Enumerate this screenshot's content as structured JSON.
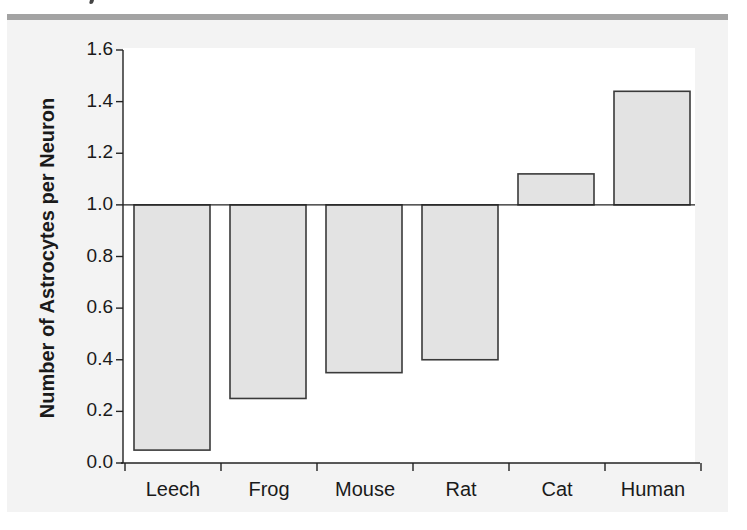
{
  "chart_data": {
    "type": "bar",
    "title": "",
    "xlabel": "",
    "ylabel": "Number of Astrocytes per Neuron",
    "categories": [
      "Leech",
      "Frog",
      "Mouse",
      "Rat",
      "Cat",
      "Human"
    ],
    "values": [
      0.05,
      0.25,
      0.35,
      0.4,
      1.12,
      1.44
    ],
    "baseline": 1.0,
    "ylim": [
      0.0,
      1.6
    ],
    "yticks": [
      "0.0",
      "0.2",
      "0.4",
      "0.6",
      "0.8",
      "1.0",
      "1.2",
      "1.4",
      "1.6"
    ],
    "grid": false,
    "legend": null,
    "colors": {
      "bar_fill": "#e3e3e3",
      "bar_stroke": "#3a3a3a",
      "axis": "#222222",
      "panel": "#f3f3f3",
      "band": "#a3a3a3"
    }
  }
}
